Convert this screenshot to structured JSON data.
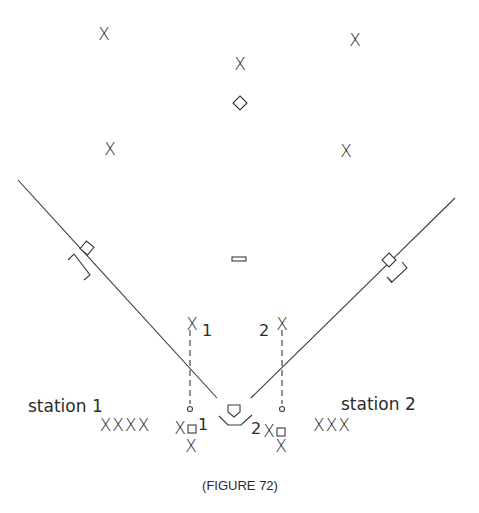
{
  "figure": {
    "caption": "(FIGURE 72)"
  },
  "fielders": {
    "left_field": "X",
    "center_field": "X",
    "right_field": "X",
    "shortstop": "X",
    "second_base": "X",
    "fungo_left": "X",
    "fungo_right": "X",
    "catcher_left": "X",
    "catcher_right": "X",
    "hitter_left": "X",
    "hitter_right": "X"
  },
  "markers": {
    "fungo_left_number": "1",
    "fungo_right_number": "2",
    "plate_left_number": "1",
    "plate_right_number": "2"
  },
  "stations": [
    {
      "label": "station 1",
      "players": "XXXX"
    },
    {
      "label": "station 2",
      "players": "XXX"
    }
  ],
  "colors": {
    "ink": "#2b2b2b",
    "background": "#ffffff"
  }
}
